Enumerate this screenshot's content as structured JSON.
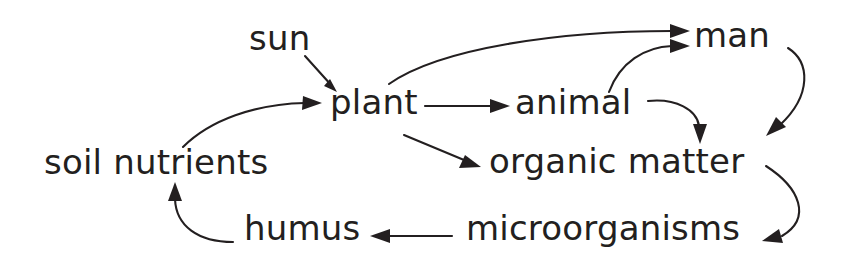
{
  "diagram": {
    "background_color": "#ffffff",
    "ink_color": "#231f20",
    "nodes": [
      {
        "id": "sun",
        "label": "sun",
        "x": 249,
        "y": 21
      },
      {
        "id": "plant",
        "label": "plant",
        "x": 330,
        "y": 85
      },
      {
        "id": "animal",
        "label": "animal",
        "x": 515,
        "y": 85
      },
      {
        "id": "man",
        "label": "man",
        "x": 694,
        "y": 18
      },
      {
        "id": "organic-matter",
        "label": "organic matter",
        "x": 489,
        "y": 144
      },
      {
        "id": "soil-nutrients",
        "label": "soil nutrients",
        "x": 44,
        "y": 145
      },
      {
        "id": "humus",
        "label": "humus",
        "x": 244,
        "y": 211
      },
      {
        "id": "microorganisms",
        "label": "microorganisms",
        "x": 466,
        "y": 211
      }
    ],
    "edges": [
      {
        "id": "sun-to-plant",
        "from": "sun",
        "to": "plant",
        "shape": "straight"
      },
      {
        "id": "soil-nutrients-to-plant",
        "from": "soil nutrients",
        "to": "plant",
        "shape": "curve"
      },
      {
        "id": "plant-to-animal",
        "from": "plant",
        "to": "animal",
        "shape": "straight"
      },
      {
        "id": "plant-to-man",
        "from": "plant",
        "to": "man",
        "shape": "curve"
      },
      {
        "id": "plant-to-organic-matter",
        "from": "plant",
        "to": "organic matter",
        "shape": "straight"
      },
      {
        "id": "animal-to-man",
        "from": "animal",
        "to": "man",
        "shape": "curve"
      },
      {
        "id": "animal-to-organic-matter",
        "from": "animal",
        "to": "organic matter",
        "shape": "curve"
      },
      {
        "id": "man-to-organic-matter",
        "from": "man",
        "to": "organic matter",
        "shape": "curve"
      },
      {
        "id": "organic-matter-to-microorganisms",
        "from": "organic matter",
        "to": "microorganisms",
        "shape": "curve"
      },
      {
        "id": "microorganisms-to-humus",
        "from": "microorganisms",
        "to": "humus",
        "shape": "straight"
      },
      {
        "id": "humus-to-soil-nutrients",
        "from": "humus",
        "to": "soil nutrients",
        "shape": "curve"
      }
    ]
  }
}
